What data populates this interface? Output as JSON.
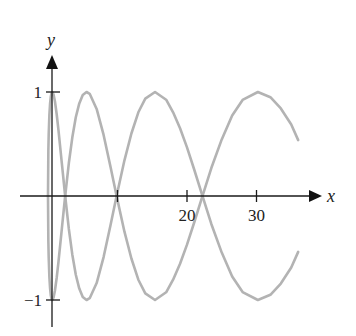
{
  "chart_data": {
    "type": "line",
    "title": "",
    "xlabel": "x",
    "ylabel": "y",
    "xlim": [
      0,
      38
    ],
    "ylim": [
      -1.2,
      1.4
    ],
    "grid": false,
    "legend": null,
    "x_ticks": [
      {
        "value": 10,
        "label": ""
      },
      {
        "value": 20,
        "label": "20"
      },
      {
        "value": 30,
        "label": "30"
      }
    ],
    "y_ticks": [
      {
        "value": 1,
        "label": "1"
      },
      {
        "value": -1,
        "label": "−1"
      }
    ],
    "curve_color": "#b3b3b3",
    "axis_color": "#1a1a1a",
    "x": [
      0,
      0.05,
      0.1,
      0.2,
      0.3,
      0.4,
      0.5,
      0.62,
      0.8,
      1,
      1.25,
      1.5,
      2,
      2.47,
      3,
      3.5,
      4,
      4.5,
      5,
      5.55,
      6,
      7,
      8,
      9,
      9.87,
      11,
      12,
      13,
      14,
      15.4,
      17,
      18,
      19,
      20,
      21,
      22.2,
      23.5,
      25,
      26.5,
      28,
      30.2,
      32,
      33.5,
      35,
      36
    ],
    "series": [
      {
        "name": "y = sin(2√x)",
        "values": [
          0,
          0.432,
          0.591,
          0.78,
          0.889,
          0.954,
          0.988,
          1.0,
          0.976,
          0.909,
          0.786,
          0.638,
          0.308,
          0.0,
          -0.317,
          -0.564,
          -0.757,
          -0.89,
          -0.971,
          -1.0,
          -0.983,
          -0.837,
          -0.587,
          -0.279,
          0.0,
          0.343,
          0.601,
          0.805,
          0.936,
          1.0,
          0.926,
          0.805,
          0.652,
          0.468,
          0.262,
          0.005,
          -0.269,
          -0.544,
          -0.775,
          -0.924,
          -1.0,
          -0.95,
          -0.842,
          -0.688,
          -0.537
        ]
      },
      {
        "name": "y = −sin(2√x)",
        "values": [
          0,
          -0.432,
          -0.591,
          -0.78,
          -0.889,
          -0.954,
          -0.988,
          -1.0,
          -0.976,
          -0.909,
          -0.786,
          -0.638,
          -0.308,
          0.0,
          0.317,
          0.564,
          0.757,
          0.89,
          0.971,
          1.0,
          0.983,
          0.837,
          0.587,
          0.279,
          0.0,
          -0.343,
          -0.601,
          -0.805,
          -0.936,
          -1.0,
          -0.926,
          -0.805,
          -0.652,
          -0.468,
          -0.262,
          -0.005,
          0.269,
          0.544,
          0.775,
          0.924,
          1.0,
          0.95,
          0.842,
          0.688,
          0.537
        ]
      }
    ]
  }
}
